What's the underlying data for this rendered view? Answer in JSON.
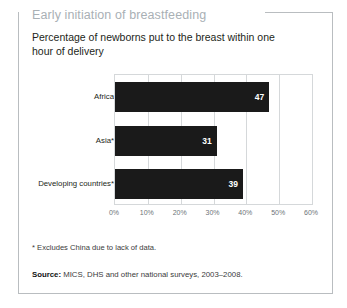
{
  "panel": {
    "title": "Early initiation of breastfeeding",
    "subtitle": "Percentage of newborns put to the breast within one hour of delivery",
    "footnote_marker": "*",
    "footnote": "Excludes China due to lack of data.",
    "source_label": "Source:",
    "source_text": "MICS, DHS and other national surveys, 2003–2008."
  },
  "colors": {
    "bar": "#1a1a1a",
    "title": "#a9b0b5",
    "grid": "#d5d8da",
    "frame": "#b9bdc0",
    "value_label": "#ffffff"
  },
  "chart_data": {
    "type": "bar",
    "orientation": "horizontal",
    "title": "Early initiation of breastfeeding",
    "subtitle": "Percentage of newborns put to the breast within one hour of delivery",
    "categories": [
      "Africa",
      "Asia*",
      "Developing countries*"
    ],
    "values": [
      47,
      31,
      39
    ],
    "value_labels": [
      "47",
      "31",
      "39"
    ],
    "xlabel": "",
    "ylabel": "",
    "xlim": [
      0,
      60
    ],
    "xticks": [
      0,
      10,
      20,
      30,
      40,
      50,
      60
    ],
    "xtick_labels": [
      "0%",
      "10%",
      "20%",
      "30%",
      "40%",
      "50%",
      "60%"
    ],
    "grid": true,
    "legend": false
  }
}
